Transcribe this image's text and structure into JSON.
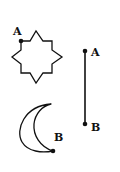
{
  "figure": {
    "shapes": [
      {
        "name": "eight-point-star",
        "point_label": "A"
      },
      {
        "name": "line-segment",
        "endpoint_labels": [
          "A",
          "B"
        ]
      },
      {
        "name": "crescent",
        "point_label": "B"
      }
    ],
    "labels": {
      "star_a": "A",
      "line_a": "A",
      "line_b": "B",
      "crescent_b": "B"
    },
    "colors": {
      "stroke": "#111111",
      "background": "#ffffff"
    }
  }
}
